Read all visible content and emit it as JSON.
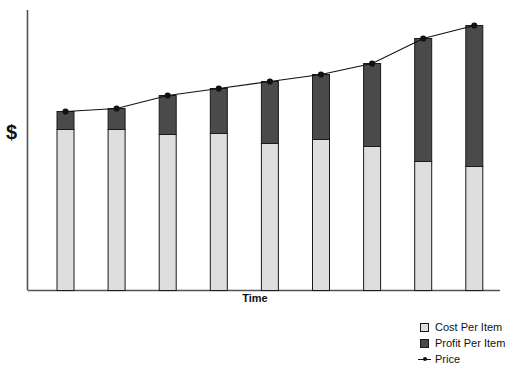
{
  "chart_data": {
    "type": "bar",
    "title": "",
    "subtitle": "",
    "xlabel": "Time",
    "ylabel": "$",
    "stacked": true,
    "grid": false,
    "legend_position": "bottom-right",
    "categories": [
      "1",
      "2",
      "3",
      "4",
      "5",
      "6",
      "7",
      "8",
      "9"
    ],
    "series": [
      {
        "name": "Cost Per Item",
        "color": "#dedede",
        "values": [
          161,
          161,
          156,
          157,
          147,
          151,
          144,
          129,
          124
        ]
      },
      {
        "name": "Profit Per Item",
        "color": "#4a4a4a",
        "values": [
          18,
          21,
          39,
          45,
          62,
          65,
          83,
          123,
          141
        ]
      },
      {
        "name": "Price",
        "color": "#111111",
        "type": "line",
        "values": [
          179,
          182,
          195,
          202,
          209,
          216,
          227,
          252,
          265
        ]
      }
    ],
    "axis": {
      "y_axis_visible": true,
      "x_axis_visible": true,
      "y_ticks": [],
      "x_ticks": [],
      "ylim": [
        0,
        290
      ],
      "note": "Axes are unlabeled; values are relative units read off bar pixel heights."
    },
    "annotations": []
  },
  "legend": {
    "items": [
      {
        "label": "Cost Per Item",
        "marker": "square-light"
      },
      {
        "label": "Profit Per Item",
        "marker": "square-dark"
      },
      {
        "label": "Price",
        "marker": "line-with-dot"
      }
    ]
  },
  "labels": {
    "y_axis": "$",
    "x_axis": "Time"
  },
  "caption": {
    "text": ""
  },
  "colors": {
    "cost": "#dedede",
    "profit": "#4a4a4a",
    "line": "#111111",
    "axis": "#555555",
    "background": "#ffffff"
  }
}
